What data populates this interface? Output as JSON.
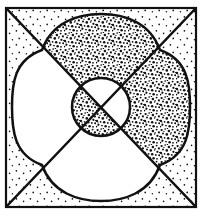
{
  "figure": {
    "title": "Quatrefoil in square with central circle",
    "medium": "line-art",
    "background_color": "#ffffff",
    "ink_color": "#111111"
  },
  "canvas": {
    "width": 204,
    "height": 216
  },
  "geometry": {
    "square": {
      "name": "outer-square-frame",
      "left": 6,
      "top": 8,
      "right": 196,
      "bottom": 207,
      "stroke_width": 2.2
    },
    "diagonals": [
      {
        "name": "main-diagonal",
        "from": [
          6,
          8
        ],
        "to": [
          196,
          207
        ],
        "stroke_width": 2.4
      },
      {
        "name": "anti-diagonal",
        "from": [
          196,
          8
        ],
        "to": [
          6,
          207
        ],
        "stroke_width": 2.4
      }
    ],
    "quatrefoil": {
      "name": "four-lobed-quatrefoil",
      "center": [
        101,
        107
      ],
      "lobe_extents": {
        "top": 14,
        "bottom": 201,
        "left": 12,
        "right": 190
      },
      "cusps": [
        [
          42,
          50
        ],
        [
          160,
          50
        ],
        [
          160,
          165
        ],
        [
          42,
          165
        ]
      ],
      "stroke_width": 2.4
    },
    "center_circle": {
      "name": "center-circle",
      "cx": 101,
      "cy": 107,
      "r": 29,
      "stroke_width": 2.4
    }
  },
  "fills": {
    "stipple_dense": {
      "name": "dense-stipple-fill",
      "region": "above-right of main diagonal, inside quatrefoil, outside center circle",
      "color": "#111111",
      "density": "dense"
    },
    "stipple_dense_inverted": {
      "name": "dense-stipple-fill-inverted",
      "region": "below-left of main diagonal, inside center circle",
      "color": "#111111",
      "density": "dense"
    },
    "white_region": {
      "name": "white-fill",
      "region": "below-left of main diagonal, inside quatrefoil, outside center circle",
      "color": "#ffffff"
    },
    "white_region_inverted": {
      "name": "white-fill-inverted",
      "region": "above-right of main diagonal, inside center circle",
      "color": "#ffffff"
    },
    "stipple_sparse": {
      "name": "sparse-dot-fill",
      "region": "square corners outside the quatrefoil",
      "color": "#111111",
      "density": "sparse"
    }
  },
  "labels": {
    "figure_caption": ""
  }
}
